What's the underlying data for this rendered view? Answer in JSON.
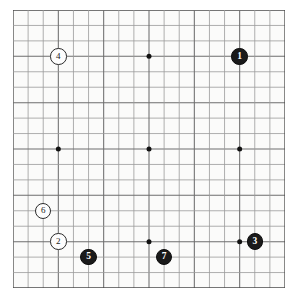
{
  "diagram": {
    "board_size": 19,
    "background_color": "#fbfbfa",
    "grid_color": "#6e6e6e",
    "grid_color_light": "#9a9a9a",
    "border_color": "#4a4a4a",
    "star_point_color": "#121212",
    "black_stone_color": "#1a1a1a",
    "white_stone_color": "#fdfdfd",
    "stone_outline_color": "#2b2b2b"
  },
  "chart_data": {
    "type": "scatter",
    "xlabel": "",
    "ylabel": "",
    "board_size": 19,
    "grid": true,
    "star_points": [
      {
        "col": 3,
        "row": 3
      },
      {
        "col": 9,
        "row": 3
      },
      {
        "col": 3,
        "row": 9
      },
      {
        "col": 9,
        "row": 9
      },
      {
        "col": 15,
        "row": 9
      },
      {
        "col": 9,
        "row": 15
      },
      {
        "col": 15,
        "row": 15
      }
    ],
    "series": [
      {
        "name": "Black",
        "color": "#1a1a1a",
        "values": [
          {
            "move": "1",
            "col": 15,
            "row": 3
          },
          {
            "move": "3",
            "col": 16,
            "row": 15
          },
          {
            "move": "5",
            "col": 5,
            "row": 16
          },
          {
            "move": "7",
            "col": 10,
            "row": 16
          }
        ]
      },
      {
        "name": "White",
        "color": "#fdfdfd",
        "values": [
          {
            "move": "2",
            "col": 3,
            "row": 15
          },
          {
            "move": "4",
            "col": 3,
            "row": 3
          },
          {
            "move": "6",
            "col": 2,
            "row": 13
          }
        ]
      }
    ]
  },
  "stones": [
    {
      "move": "1",
      "color": "black",
      "col": 15,
      "row": 3
    },
    {
      "move": "2",
      "color": "white",
      "col": 3,
      "row": 15
    },
    {
      "move": "3",
      "color": "black",
      "col": 16,
      "row": 15
    },
    {
      "move": "4",
      "color": "white",
      "col": 3,
      "row": 3
    },
    {
      "move": "5",
      "color": "black",
      "col": 5,
      "row": 16
    },
    {
      "move": "6",
      "color": "white",
      "col": 2,
      "row": 13
    },
    {
      "move": "7",
      "color": "black",
      "col": 10,
      "row": 16
    }
  ]
}
